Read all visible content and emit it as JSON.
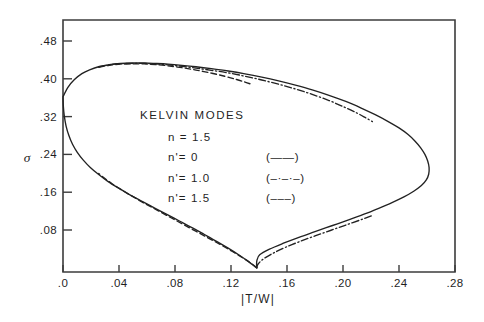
{
  "figure": {
    "background_color": "#ffffff",
    "ink_color": "#222222"
  },
  "chart_data": {
    "type": "line",
    "title": "",
    "xlabel": "|T/W|",
    "ylabel": "σ",
    "xlim": [
      0.0,
      0.28
    ],
    "ylim": [
      0.0,
      0.52
    ],
    "grid": false,
    "legend_position": "center-left-inside",
    "x_ticks": [
      ".0",
      ".04",
      ".08",
      ".12",
      ".16",
      ".20",
      ".24",
      ".28"
    ],
    "x_tick_values": [
      0.0,
      0.04,
      0.08,
      0.12,
      0.16,
      0.2,
      0.24,
      0.28
    ],
    "y_ticks": [
      ".08",
      ".16",
      ".24",
      ".32",
      ".40",
      ".48"
    ],
    "y_tick_values": [
      0.08,
      0.16,
      0.24,
      0.32,
      0.4,
      0.48
    ],
    "annotations": [
      {
        "text": "KELVIN MODES",
        "x": 0.055,
        "y": 0.315
      },
      {
        "text": "n = 1.5",
        "x": 0.075,
        "y": 0.268
      },
      {
        "text": "n'= 0",
        "x": 0.075,
        "y": 0.225
      },
      {
        "text": "n'= 1.0",
        "x": 0.075,
        "y": 0.182
      },
      {
        "text": "n'= 1.5",
        "x": 0.075,
        "y": 0.139
      }
    ],
    "legend_keys": [
      {
        "label": "(——)",
        "style": "solid"
      },
      {
        "label": "(–·–·–)",
        "style": "dashdot"
      },
      {
        "label": "(–––)",
        "style": "dashed"
      }
    ],
    "series": [
      {
        "name": "n'= 0",
        "style": "solid",
        "points": [
          [
            0.0,
            0.362
          ],
          [
            0.0035,
            0.382
          ],
          [
            0.008,
            0.398
          ],
          [
            0.0135,
            0.411
          ],
          [
            0.019,
            0.419
          ],
          [
            0.026,
            0.426
          ],
          [
            0.033,
            0.43
          ],
          [
            0.041,
            0.4325
          ],
          [
            0.05,
            0.4335
          ],
          [
            0.058,
            0.4335
          ],
          [
            0.066,
            0.4325
          ],
          [
            0.075,
            0.431
          ],
          [
            0.085,
            0.4285
          ],
          [
            0.095,
            0.4255
          ],
          [
            0.106,
            0.4215
          ],
          [
            0.118,
            0.4165
          ],
          [
            0.13,
            0.4105
          ],
          [
            0.142,
            0.4035
          ],
          [
            0.154,
            0.3955
          ],
          [
            0.166,
            0.3865
          ],
          [
            0.178,
            0.3765
          ],
          [
            0.19,
            0.365
          ],
          [
            0.202,
            0.352
          ],
          [
            0.213,
            0.338
          ],
          [
            0.223,
            0.324
          ],
          [
            0.232,
            0.31
          ],
          [
            0.24,
            0.296
          ],
          [
            0.2465,
            0.282
          ],
          [
            0.2515,
            0.268
          ],
          [
            0.2555,
            0.254
          ],
          [
            0.2585,
            0.24
          ],
          [
            0.2605,
            0.226
          ],
          [
            0.2615,
            0.212
          ],
          [
            0.2612,
            0.198
          ],
          [
            0.2595,
            0.186
          ],
          [
            0.256,
            0.174
          ],
          [
            0.2505,
            0.162
          ],
          [
            0.2435,
            0.15
          ],
          [
            0.235,
            0.138
          ],
          [
            0.2255,
            0.126
          ],
          [
            0.215,
            0.1135
          ],
          [
            0.204,
            0.1015
          ],
          [
            0.192,
            0.089
          ],
          [
            0.18,
            0.0765
          ],
          [
            0.1685,
            0.0645
          ],
          [
            0.157,
            0.0515
          ],
          [
            0.1475,
            0.0395
          ],
          [
            0.1405,
            0.0275
          ],
          [
            0.1385,
            0.0155
          ],
          [
            0.1383,
            0.0045
          ],
          [
            0.1383,
            0.0
          ],
          [
            0.133,
            0.012
          ],
          [
            0.126,
            0.0265
          ],
          [
            0.118,
            0.0415
          ],
          [
            0.11,
            0.0555
          ],
          [
            0.101,
            0.0705
          ],
          [
            0.0925,
            0.0845
          ],
          [
            0.0835,
            0.0985
          ],
          [
            0.0745,
            0.1125
          ],
          [
            0.0655,
            0.1265
          ],
          [
            0.0565,
            0.1405
          ],
          [
            0.0475,
            0.155
          ],
          [
            0.0395,
            0.169
          ],
          [
            0.032,
            0.183
          ],
          [
            0.0255,
            0.1975
          ],
          [
            0.0195,
            0.2125
          ],
          [
            0.0145,
            0.228
          ],
          [
            0.0102,
            0.2445
          ],
          [
            0.0068,
            0.2615
          ],
          [
            0.0042,
            0.28
          ],
          [
            0.0022,
            0.3
          ],
          [
            0.0009,
            0.322
          ],
          [
            0.0002,
            0.344
          ],
          [
            0.0,
            0.362
          ]
        ]
      },
      {
        "name": "n'= 1.0",
        "style": "dashdot",
        "upper_points": [
          [
            0.026,
            0.4255
          ],
          [
            0.033,
            0.4295
          ],
          [
            0.041,
            0.432
          ],
          [
            0.05,
            0.4325
          ],
          [
            0.058,
            0.4325
          ],
          [
            0.066,
            0.4315
          ],
          [
            0.075,
            0.4295
          ],
          [
            0.085,
            0.4265
          ],
          [
            0.095,
            0.4225
          ],
          [
            0.106,
            0.418
          ],
          [
            0.118,
            0.4125
          ],
          [
            0.13,
            0.4055
          ],
          [
            0.142,
            0.3975
          ],
          [
            0.154,
            0.3885
          ],
          [
            0.166,
            0.3785
          ],
          [
            0.178,
            0.367
          ],
          [
            0.19,
            0.354
          ],
          [
            0.201,
            0.34
          ],
          [
            0.21,
            0.3275
          ],
          [
            0.2165,
            0.317
          ],
          [
            0.221,
            0.3095
          ]
        ],
        "lower_points": [
          [
            0.1383,
            0.0
          ],
          [
            0.1395,
            0.0085
          ],
          [
            0.1435,
            0.0195
          ],
          [
            0.1505,
            0.0315
          ],
          [
            0.159,
            0.0435
          ],
          [
            0.169,
            0.0555
          ],
          [
            0.18,
            0.0675
          ],
          [
            0.1915,
            0.0795
          ],
          [
            0.203,
            0.0915
          ],
          [
            0.2145,
            0.1035
          ],
          [
            0.2205,
            0.11
          ]
        ]
      },
      {
        "name": "n'= 1.5",
        "style": "dashed",
        "upper_points": [
          [
            0.0255,
            0.4245
          ],
          [
            0.033,
            0.4285
          ],
          [
            0.041,
            0.431
          ],
          [
            0.05,
            0.4315
          ],
          [
            0.058,
            0.4315
          ],
          [
            0.066,
            0.43
          ],
          [
            0.075,
            0.4275
          ],
          [
            0.085,
            0.4235
          ],
          [
            0.095,
            0.4185
          ],
          [
            0.106,
            0.412
          ],
          [
            0.116,
            0.405
          ],
          [
            0.124,
            0.3985
          ],
          [
            0.13,
            0.393
          ],
          [
            0.1345,
            0.3885
          ]
        ],
        "lower_points": [
          [
            0.1383,
            0.0
          ],
          [
            0.1355,
            0.007
          ],
          [
            0.129,
            0.02
          ],
          [
            0.121,
            0.0345
          ],
          [
            0.1125,
            0.049
          ],
          [
            0.1035,
            0.0635
          ],
          [
            0.0945,
            0.078
          ],
          [
            0.0855,
            0.0925
          ],
          [
            0.0765,
            0.107
          ],
          [
            0.0675,
            0.1215
          ],
          [
            0.0585,
            0.136
          ],
          [
            0.05,
            0.1505
          ],
          [
            0.042,
            0.1645
          ],
          [
            0.035,
            0.178
          ],
          [
            0.0295,
            0.19
          ],
          [
            0.0255,
            0.1995
          ]
        ]
      }
    ]
  }
}
